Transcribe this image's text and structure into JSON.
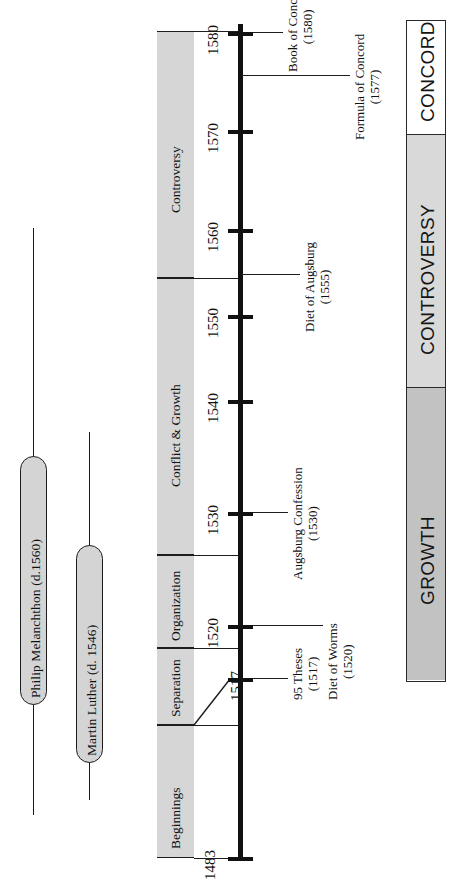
{
  "figure": {
    "orientation": "rotated-90-ccw",
    "axis": {
      "name": "reformation-timeline-axis",
      "start_year": 1483,
      "end_year": 1580,
      "ticks": [
        {
          "label": "1483",
          "year": 1483,
          "y": 857
        },
        {
          "label": "1517",
          "year": 1517,
          "y": 678
        },
        {
          "label": "1520",
          "year": 1520,
          "y": 625
        },
        {
          "label": "1530",
          "year": 1530,
          "y": 512
        },
        {
          "label": "1540",
          "year": 1540,
          "y": 400
        },
        {
          "label": "1550",
          "year": 1550,
          "y": 315
        },
        {
          "label": "1560",
          "year": 1560,
          "y": 229
        },
        {
          "label": "1570",
          "year": 1570,
          "y": 130
        },
        {
          "label": "1580",
          "year": 1580,
          "y": 32
        }
      ]
    },
    "periods": [
      {
        "label": "Beginnings",
        "top": 725,
        "bottom": 858
      },
      {
        "label": "Separation",
        "top": 648,
        "bottom": 725
      },
      {
        "label": "Organization",
        "top": 555,
        "bottom": 648
      },
      {
        "label": "Conflict & Growth",
        "top": 278,
        "bottom": 555
      },
      {
        "label": "Controversy",
        "top": 31,
        "bottom": 278
      }
    ],
    "people": [
      {
        "label": "Philip Melanchthon (d.1560)",
        "line_x": 33,
        "line_top": 228,
        "line_bottom": 815,
        "pill_top": 456,
        "pill_bottom": 705
      },
      {
        "label": "Martin Luther (d. 1546)",
        "line_x": 89,
        "line_top": 432,
        "line_bottom": 800,
        "pill_top": 545,
        "pill_bottom": 763
      }
    ],
    "events": [
      {
        "name": "95-theses",
        "lines": [
          "95 Theses",
          "(1517)"
        ],
        "year": 1517,
        "tick_y": 678,
        "conn_from_x": 253,
        "conn_to_x": 288,
        "label_x": 300
      },
      {
        "name": "diet-of-worms",
        "lines": [
          "Diet of Worms",
          "(1520)"
        ],
        "year": 1520,
        "tick_y": 625,
        "conn_from_x": 253,
        "conn_to_x": 323,
        "label_x": 335
      },
      {
        "name": "augsburg-confession",
        "lines": [
          "Augsburg Confession",
          "(1530)"
        ],
        "year": 1530,
        "tick_y": 512,
        "conn_from_x": 253,
        "conn_to_x": 288,
        "label_x": 300
      },
      {
        "name": "diet-of-augsburg",
        "lines": [
          "Diet of Augsburg",
          "(1555)"
        ],
        "year": 1555,
        "tick_y": 274,
        "conn_from_x": 241,
        "conn_to_x": 300,
        "label_x": 312
      },
      {
        "name": "formula-of-concord",
        "lines": [
          "Formula of Concord",
          "(1577)"
        ],
        "year": 1577,
        "tick_y": 75,
        "conn_from_x": 241,
        "conn_to_x": 350,
        "label_x": 362
      },
      {
        "name": "book-of-concord",
        "lines": [
          "Book of Concord",
          "(1580)"
        ],
        "year": 1580,
        "tick_y": 32,
        "conn_from_x": 253,
        "conn_to_x": 283,
        "label_x": 296
      }
    ],
    "phase_bar": {
      "top": 20,
      "bottom": 682,
      "segments": [
        {
          "label": "CONCORD",
          "top": 20,
          "bottom": 135,
          "color": "#ffffff"
        },
        {
          "label": "CONTROVERSY",
          "top": 135,
          "bottom": 388,
          "color": "#d9d9d9"
        },
        {
          "label": "GROWTH",
          "top": 388,
          "bottom": 682,
          "color": "#c2c2c2"
        }
      ]
    }
  }
}
